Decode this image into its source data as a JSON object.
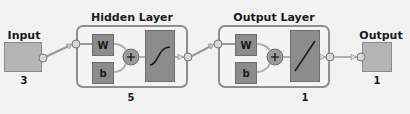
{
  "diagram": {
    "input": {
      "label": "Input",
      "size": "3"
    },
    "hidden_layer": {
      "title": "Hidden Layer",
      "size": "5",
      "weight_label": "W",
      "bias_label": "b",
      "sum_symbol": "+",
      "transfer_function": "sigmoid"
    },
    "output_layer": {
      "title": "Output Layer",
      "size": "1",
      "weight_label": "W",
      "bias_label": "b",
      "sum_symbol": "+",
      "transfer_function": "linear"
    },
    "output": {
      "label": "Output",
      "size": "1"
    },
    "colors": {
      "block_fill": "#8c8c8c",
      "io_fill": "#b5b5b5",
      "layer_border": "#8f8f8f",
      "background": "#f2f2f2"
    }
  }
}
